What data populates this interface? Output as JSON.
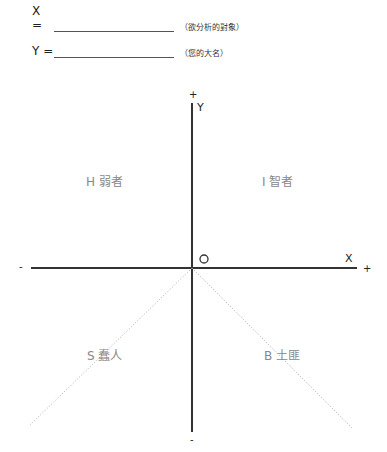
{
  "form": {
    "x_label": "X =",
    "x_hint": "（欲分析的對象）",
    "y_label": "Y =",
    "y_hint": "（您的大名）"
  },
  "axes": {
    "y_axis_label": "Y",
    "x_axis_label": "X",
    "origin_label": "O",
    "y_plus": "+",
    "y_minus": "-",
    "x_plus": "+",
    "x_minus": "-"
  },
  "quadrants": {
    "top_left": "H 弱者",
    "top_right": "I 智者",
    "bottom_left": "S 蠢人",
    "bottom_right": "B 土匪"
  },
  "colors": {
    "axis": "#333333",
    "diagonal": "#aaaaaa",
    "quadrant_text": "#888888"
  }
}
